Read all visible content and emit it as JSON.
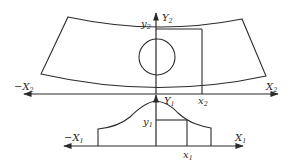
{
  "figure": {
    "type": "coordinate-transformation diagram",
    "upper_panel": {
      "shape": "curved strip (arched quadrilateral) with inscribed circle",
      "axis_labels": {
        "x_neg": "−X",
        "x_neg_sub": "2",
        "x_pos": "X",
        "x_pos_sub": "2",
        "y_pos": "Y",
        "y_pos_sub": "2"
      },
      "point_labels": {
        "x": "x",
        "x_sub": "2",
        "y": "y",
        "y_sub": "2"
      }
    },
    "lower_panel": {
      "shape": "bell-shaped profile with flat stepped ends",
      "axis_labels": {
        "x_neg": "−X",
        "x_neg_sub": "1",
        "x_pos": "X",
        "x_pos_sub": "1",
        "y_pos": "Y",
        "y_pos_sub": "1"
      },
      "point_labels": {
        "x": "x",
        "x_sub": "1",
        "y": "y",
        "y_sub": "1"
      }
    },
    "colors": {
      "line": "#2b2b2b",
      "background": "#ffffff"
    }
  }
}
